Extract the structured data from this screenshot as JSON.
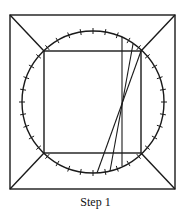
{
  "figure": {
    "caption": "Step 1",
    "stroke_color": "#1a1a1a",
    "outer_square": {
      "x1": 10,
      "y1": 15,
      "x2": 175,
      "y2": 189
    },
    "inner_square": {
      "x1": 44,
      "y1": 51,
      "x2": 141,
      "y2": 153
    },
    "circle": {
      "cx": 93,
      "cy": 102,
      "r": 71,
      "tick_count": 36
    },
    "chords": [
      {
        "x1": 122,
        "y1": 37,
        "x2": 122,
        "y2": 166
      },
      {
        "x1": 133,
        "y1": 44,
        "x2": 110,
        "y2": 171
      },
      {
        "x1": 141,
        "y1": 51,
        "x2": 97,
        "y2": 173
      }
    ]
  }
}
